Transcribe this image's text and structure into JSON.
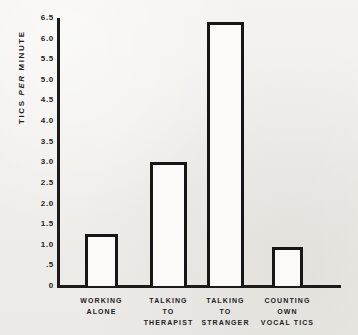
{
  "chart_data": {
    "type": "bar",
    "title": "",
    "subtitle": "",
    "xlabel": "",
    "ylabel": "TICS PER MINUTE",
    "ylabel_parts": [
      "TICS ",
      "PER",
      " MINUTE"
    ],
    "categories": [
      "WORKING ALONE",
      "TALKING TO THERAPIST",
      "TALKING TO STRANGER",
      "COUNTING OWN VOCAL TICS"
    ],
    "category_lines": [
      [
        "WORKING",
        "ALONE"
      ],
      [
        "TALKING",
        "TO",
        "THERAPIST"
      ],
      [
        "TALKING",
        "TO",
        "STRANGER"
      ],
      [
        "COUNTING",
        "OWN",
        "VOCAL TICS"
      ]
    ],
    "values": [
      1.25,
      3.0,
      6.4,
      0.95
    ],
    "ylim": [
      0,
      6.5
    ],
    "ytick_values": [
      0,
      0.5,
      1.0,
      1.5,
      2.0,
      2.5,
      3.0,
      3.5,
      4.0,
      4.5,
      5.0,
      5.5,
      6.0,
      6.5
    ],
    "ytick_labels": [
      "0",
      ".5",
      "1.0",
      "1.5",
      "2.0",
      "2.5",
      "3.0",
      "3.5",
      "4.0",
      "4.5",
      "5.0",
      "5.5",
      "6.0",
      "6.5"
    ],
    "grid": false,
    "legend": null,
    "legend_position": "none",
    "bar_style": "outlined",
    "colors": {
      "background": "#f2f1ef",
      "axis": "#1b1b1b",
      "bar_edge": "#161616",
      "bar_fill": "#fbfaf8",
      "text": "#1d1d1d"
    }
  }
}
